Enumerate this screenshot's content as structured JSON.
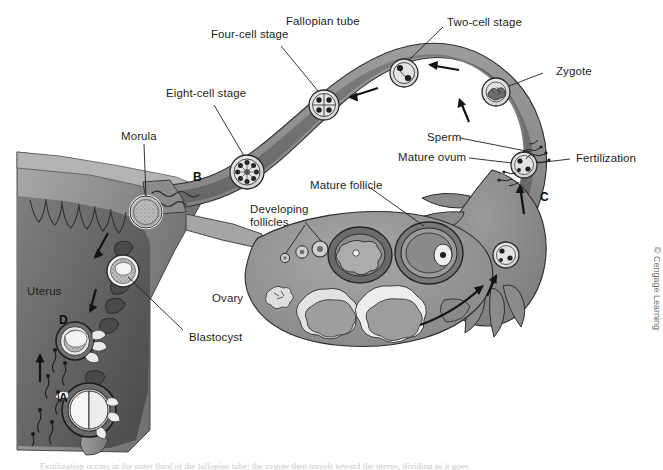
{
  "figure": {
    "credit": "© Cengage Learning",
    "caption_partial": "Fertilization occurs in the outer third of the fallopian tube; the zygote then travels toward the uterus, dividing as it goes."
  },
  "labels": {
    "eight_cell_stage": "Eight-cell stage",
    "four_cell_stage": "Four-cell stage",
    "fallopian_tube": "Fallopian tube",
    "two_cell_stage": "Two-cell stage",
    "zygote": "Zygote",
    "morula": "Morula",
    "sperm": "Sperm",
    "mature_ovum": "Mature ovum",
    "fertilization": "Fertilization",
    "mature_follicle": "Mature follicle",
    "developing_follicles": "Developing\nfollicles",
    "developing_follicles_line1": "Developing",
    "developing_follicles_line2": "follicles",
    "ovary": "Ovary",
    "uterus": "Uterus",
    "blastocyst": "Blastocyst"
  },
  "markers": {
    "a": "A",
    "b": "B",
    "c": "C",
    "d": "D"
  },
  "colors": {
    "background": "#ffffff",
    "tube_wall": "#8c8c8c",
    "tube_lumen": "#6e6e6e",
    "ovary_body": "#9a9a9a",
    "uterus_wall": "#8f8f8f",
    "uterus_cavity": "#707070",
    "endometrium_dark": "#5c5c5c",
    "outline": "#2b2b2b",
    "cell_fill": "#d8d8d8",
    "follicle_light": "#e8e8e8",
    "label_text": "#231f20",
    "credit_text": "#6f6f6f"
  },
  "stages": {
    "two_cell": {
      "name": "two-cell-stage-cell",
      "nuclei": 2
    },
    "four_cell": {
      "name": "four-cell-stage-cell",
      "nuclei": 4
    },
    "eight_cell": {
      "name": "eight-cell-stage-cell",
      "nuclei": 8
    },
    "morula": {
      "name": "morula-cell"
    },
    "blastocyst": {
      "name": "blastocyst-cell"
    }
  }
}
